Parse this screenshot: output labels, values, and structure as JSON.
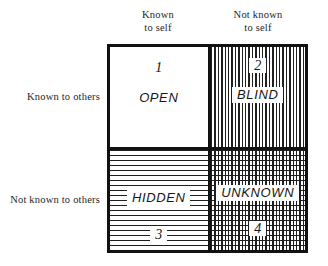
{
  "diagram": {
    "axes": {
      "columns": [
        {
          "id": "known-to-self",
          "line1": "Known",
          "line2": "to self"
        },
        {
          "id": "not-known-to-self",
          "line1": "Not known",
          "line2": "to self"
        }
      ],
      "rows": [
        {
          "id": "known-to-others",
          "label": "Known to others"
        },
        {
          "id": "not-known-to-others",
          "label": "Not known to others"
        }
      ]
    },
    "quadrants": [
      {
        "id": "open",
        "number": "1",
        "name": "OPEN",
        "fill": "none",
        "position": "top-left",
        "order": "number-then-name"
      },
      {
        "id": "blind",
        "number": "2",
        "name": "BLIND",
        "fill": "vertical-hatch",
        "position": "top-right",
        "order": "number-then-name"
      },
      {
        "id": "hidden",
        "number": "3",
        "name": "HIDDEN",
        "fill": "horizontal-hatch",
        "position": "bottom-left",
        "order": "name-then-number"
      },
      {
        "id": "unknown",
        "number": "4",
        "name": "UNKNOWN",
        "fill": "cross-hatch",
        "position": "bottom-right",
        "order": "name-then-number"
      }
    ],
    "colors": {
      "ink": "#111111",
      "hatch": "#1f1f1f",
      "paper": "#ffffff",
      "label_text": "#262626"
    }
  }
}
